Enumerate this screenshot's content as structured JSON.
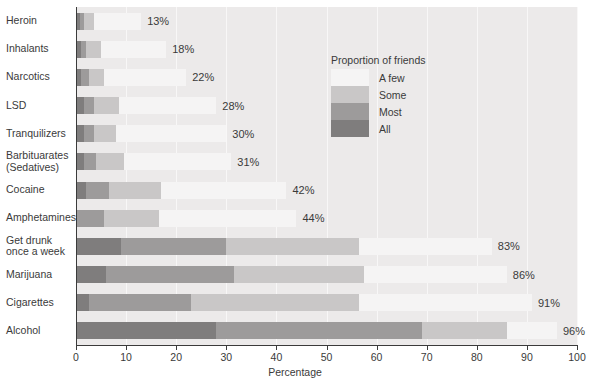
{
  "chart_data": {
    "type": "bar",
    "orientation": "horizontal",
    "stacked": true,
    "title": "",
    "xlabel": "Percentage",
    "ylabel": "",
    "xlim": [
      0,
      100
    ],
    "xticks": [
      0,
      10,
      20,
      30,
      40,
      50,
      60,
      70,
      80,
      90,
      100
    ],
    "grid": true,
    "legend_position": "inside-upper-right",
    "legend_title": "Proportion of friends",
    "categories": [
      "Heroin",
      "Inhalants",
      "Narcotics",
      "LSD",
      "Tranquilizers",
      "Barbituarates (Sedatives)",
      "Cocaine",
      "Amphetamines",
      "Get drunk once a week",
      "Marijuana",
      "Cigarettes",
      "Alcohol"
    ],
    "series": [
      {
        "name": "All",
        "values": [
          0.8,
          1.0,
          1.0,
          1.5,
          1.5,
          1.5,
          2.0,
          0.0,
          9.0,
          6.0,
          2.5,
          28.0
        ]
      },
      {
        "name": "Most",
        "values": [
          0.7,
          1.0,
          1.5,
          2.0,
          2.0,
          2.5,
          4.5,
          5.5,
          21.0,
          25.5,
          20.5,
          41.0
        ]
      },
      {
        "name": "Some",
        "values": [
          2.0,
          3.0,
          3.0,
          5.0,
          4.5,
          5.5,
          10.5,
          11.0,
          26.5,
          26.0,
          33.5,
          17.0
        ]
      },
      {
        "name": "A few",
        "values": [
          9.5,
          13.0,
          16.5,
          19.5,
          22.0,
          21.5,
          25.0,
          27.5,
          26.5,
          28.5,
          34.5,
          10.0
        ]
      }
    ],
    "totals": [
      13,
      18,
      22,
      28,
      30,
      31,
      42,
      44,
      83,
      86,
      91,
      96
    ],
    "value_labels": [
      "13%",
      "18%",
      "22%",
      "28%",
      "30%",
      "31%",
      "42%",
      "44%",
      "83%",
      "86%",
      "91%",
      "96%"
    ],
    "colors": {
      "A few": "#f5f4f4",
      "Some": "#c9c7c7",
      "Most": "#9d9b9b",
      "All": "#7f7d7d",
      "plot_background": "#eceaea",
      "gridline": "#f8f7f7",
      "axis": "#3b3b3b",
      "text": "#3a3a3a"
    }
  },
  "labels": {
    "rows": [
      {
        "line1": "Heroin",
        "line2": ""
      },
      {
        "line1": "Inhalants",
        "line2": ""
      },
      {
        "line1": "Narcotics",
        "line2": ""
      },
      {
        "line1": "LSD",
        "line2": ""
      },
      {
        "line1": "Tranquilizers",
        "line2": ""
      },
      {
        "line1": "Barbituarates",
        "line2": "(Sedatives)"
      },
      {
        "line1": "Cocaine",
        "line2": ""
      },
      {
        "line1": "Amphetamines",
        "line2": ""
      },
      {
        "line1": "Get drunk",
        "line2": "once a week"
      },
      {
        "line1": "Marijuana",
        "line2": ""
      },
      {
        "line1": "Cigarettes",
        "line2": ""
      },
      {
        "line1": "Alcohol",
        "line2": ""
      }
    ]
  },
  "axis": {
    "tick_labels": [
      "0",
      "10",
      "20",
      "30",
      "40",
      "50",
      "60",
      "70",
      "80",
      "90",
      "100"
    ],
    "title": "Percentage"
  },
  "legend": {
    "title": "Proportion of friends",
    "items": [
      {
        "label": "A few",
        "color": "#f5f4f4"
      },
      {
        "label": "Some",
        "color": "#c9c7c7"
      },
      {
        "label": "Most",
        "color": "#9d9b9b"
      },
      {
        "label": "All",
        "color": "#7f7d7d"
      }
    ]
  }
}
